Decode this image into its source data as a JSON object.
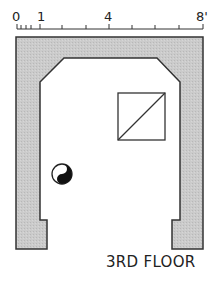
{
  "scale": {
    "labels": [
      "0",
      "1",
      "4",
      "8'"
    ],
    "unit": "feet",
    "max": 8
  },
  "plan": {
    "caption": "3RD FLOOR",
    "wall_color": "#c9c9c9",
    "line_color": "#333333",
    "features": [
      "window-square-with-diagonal",
      "fixture-circle-half-filled"
    ]
  }
}
